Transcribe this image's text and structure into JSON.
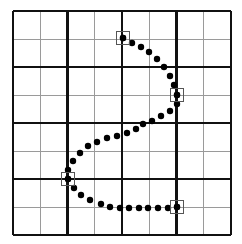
{
  "figure": {
    "width": 242,
    "height": 244,
    "background_color": "#ffffff"
  },
  "chart_data": {
    "type": "scatter",
    "xlabel": "",
    "ylabel": "",
    "xlim": [
      13,
      231
    ],
    "ylim": [
      11,
      235
    ],
    "grid": true,
    "legend": null,
    "grid_spec": {
      "origin_x": 13,
      "origin_y": 11,
      "cell_width": 27.25,
      "cell_height": 28,
      "columns": 8,
      "rows": 8,
      "major_every": 2,
      "major_color": "#111111",
      "minor_color": "#9a9a9a",
      "major_width": 2.6,
      "minor_width": 1,
      "vertical_x": [
        13,
        40.25,
        67.5,
        94.75,
        122,
        149.25,
        176.5,
        203.75,
        231
      ],
      "vertical_major_index": [
        0,
        2,
        4,
        6,
        8
      ],
      "horizontal_y": [
        11,
        39,
        67,
        95,
        123,
        151,
        179,
        207,
        235
      ],
      "horizontal_major_index": [
        0,
        2,
        4,
        6,
        8
      ]
    },
    "series": [
      {
        "name": "curve-dots",
        "marker": "circle",
        "marker_color": "#000000",
        "marker_radius": 3.2,
        "points": [
          [
            123,
            38
          ],
          [
            132,
            43
          ],
          [
            141,
            47
          ],
          [
            149,
            52
          ],
          [
            157,
            59
          ],
          [
            164,
            67
          ],
          [
            170,
            76
          ],
          [
            174,
            85
          ],
          [
            177,
            95
          ],
          [
            177,
            104
          ],
          [
            170,
            111
          ],
          [
            161,
            116
          ],
          [
            152,
            121
          ],
          [
            143,
            124
          ],
          [
            136,
            129
          ],
          [
            127,
            133
          ],
          [
            117,
            136
          ],
          [
            107,
            138
          ],
          [
            97,
            142
          ],
          [
            88,
            146
          ],
          [
            80,
            153
          ],
          [
            73,
            161
          ],
          [
            68,
            170
          ],
          [
            68,
            179
          ],
          [
            74,
            188
          ],
          [
            81,
            195
          ],
          [
            90,
            200
          ],
          [
            101,
            204
          ],
          [
            110,
            207
          ],
          [
            120,
            208
          ],
          [
            129,
            208
          ],
          [
            139,
            208
          ],
          [
            148,
            208
          ],
          [
            158,
            208
          ],
          [
            168,
            208
          ],
          [
            177,
            207
          ]
        ]
      }
    ],
    "control_markers": {
      "name": "square-control-points",
      "shape": "square",
      "size": 13,
      "stroke_color": "#555555",
      "center_dot_radius": 3.2,
      "center_dot_color": "#000000",
      "points": [
        [
          123,
          38
        ],
        [
          177,
          95
        ],
        [
          68,
          179
        ],
        [
          177,
          207
        ]
      ]
    }
  }
}
